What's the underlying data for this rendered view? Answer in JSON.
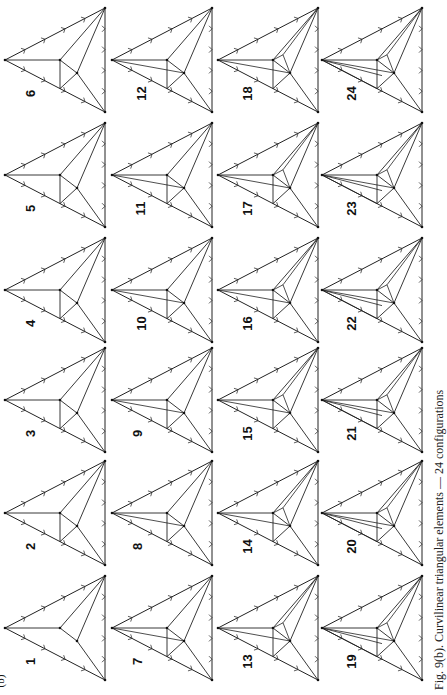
{
  "figure": {
    "part_label": "(b)",
    "caption": "Fig. 9(b). Curvilinear triangular elements — 24 configurations",
    "item_count": 24,
    "layout": "4 columns × 6 rows, page rotated 90°",
    "items": [
      {
        "num": "1"
      },
      {
        "num": "2"
      },
      {
        "num": "3"
      },
      {
        "num": "4"
      },
      {
        "num": "5"
      },
      {
        "num": "6"
      },
      {
        "num": "7"
      },
      {
        "num": "8"
      },
      {
        "num": "9"
      },
      {
        "num": "10"
      },
      {
        "num": "11"
      },
      {
        "num": "12"
      },
      {
        "num": "13"
      },
      {
        "num": "14"
      },
      {
        "num": "15"
      },
      {
        "num": "16"
      },
      {
        "num": "17"
      },
      {
        "num": "18"
      },
      {
        "num": "19"
      },
      {
        "num": "20"
      },
      {
        "num": "21"
      },
      {
        "num": "22"
      },
      {
        "num": "23"
      },
      {
        "num": "24"
      }
    ]
  }
}
